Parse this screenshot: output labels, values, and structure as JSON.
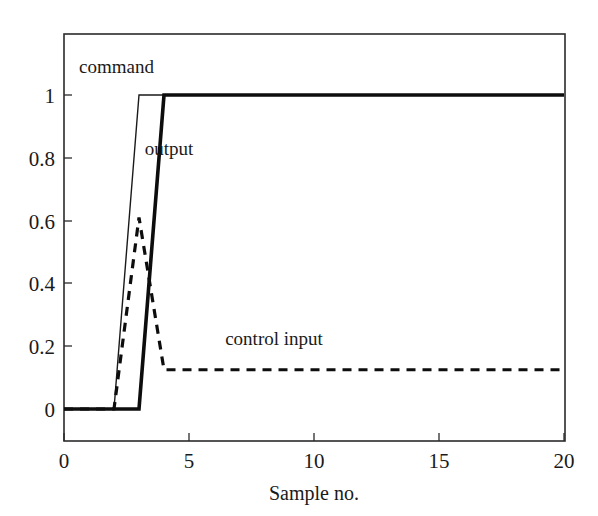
{
  "chart_data": {
    "type": "line",
    "title": "",
    "xlabel": "Sample no.",
    "ylabel": "",
    "xlim": [
      0,
      20
    ],
    "ylim": [
      -0.1,
      1.12
    ],
    "grid": false,
    "legend_position": "inline-annotations",
    "xticks": [
      0,
      5,
      10,
      15,
      20
    ],
    "xticklabels": [
      "0",
      "5",
      "10",
      "15",
      "20"
    ],
    "yticks": [
      0,
      0.2,
      0.4,
      0.6,
      0.8,
      1
    ],
    "yticklabels": [
      "0",
      "0.2",
      "0.4",
      "0.6",
      "0.8",
      "1"
    ],
    "x": [
      0,
      1,
      2,
      3,
      4,
      5,
      6,
      7,
      8,
      9,
      10,
      11,
      12,
      13,
      14,
      15,
      16,
      17,
      18,
      19,
      20
    ],
    "series": [
      {
        "name": "command",
        "style": "solid-thin",
        "color": "#1a1a1a",
        "values": [
          0,
          0,
          0,
          1,
          1,
          1,
          1,
          1,
          1,
          1,
          1,
          1,
          1,
          1,
          1,
          1,
          1,
          1,
          1,
          1,
          1
        ]
      },
      {
        "name": "output",
        "style": "solid-thick",
        "color": "#0d0d0d",
        "values": [
          0,
          0,
          0,
          0,
          1,
          1,
          1,
          1,
          1,
          1,
          1,
          1,
          1,
          1,
          1,
          1,
          1,
          1,
          1,
          1,
          1
        ]
      },
      {
        "name": "control input",
        "style": "dashed-thick",
        "color": "#0d0d0d",
        "values": [
          0,
          0,
          0,
          0.61,
          0.125,
          0.125,
          0.125,
          0.125,
          0.125,
          0.125,
          0.125,
          0.125,
          0.125,
          0.125,
          0.125,
          0.125,
          0.125,
          0.125,
          0.125,
          0.125,
          0.125
        ]
      }
    ],
    "annotations": [
      {
        "text": "command",
        "x": 2.1,
        "y": 1.07
      },
      {
        "text": "output",
        "x": 4.2,
        "y": 0.81
      },
      {
        "text": "control input",
        "x": 8.4,
        "y": 0.205
      }
    ]
  }
}
